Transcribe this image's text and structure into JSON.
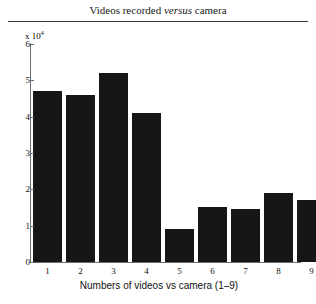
{
  "figure": {
    "title_prefix": "Videos recorded ",
    "title_emphasis": "versus",
    "title_suffix": " camera",
    "title_full": "Videos recorded versus camera",
    "background_color": "#ffffff",
    "rule_color": "#3a3a3a"
  },
  "chart_data": {
    "type": "bar",
    "title": "Videos recorded versus camera",
    "categories": [
      "1",
      "2",
      "3",
      "4",
      "5",
      "6",
      "7",
      "8",
      "9"
    ],
    "values": [
      47000,
      46000,
      52000,
      41000,
      9000,
      15000,
      14500,
      19000,
      17000
    ],
    "values_scaled": [
      4.7,
      4.6,
      5.2,
      4.1,
      0.9,
      1.5,
      1.45,
      1.9,
      1.7
    ],
    "y_multiplier_text": "x 10",
    "y_multiplier_exponent": "4",
    "y_multiplier_value": 10000,
    "xlabel": "Numbers of videos vs camera (1–9)",
    "ylabel": "",
    "ylim": [
      0,
      6
    ],
    "yticks": [
      "0",
      "1",
      "2",
      "3",
      "4",
      "5",
      "6"
    ],
    "ytick_values": [
      0,
      1,
      2,
      3,
      4,
      5,
      6
    ],
    "xlim_categories": 9,
    "grid": false,
    "legend": false,
    "bar_color": "#161616",
    "axis_color": "#6d6d6d"
  }
}
